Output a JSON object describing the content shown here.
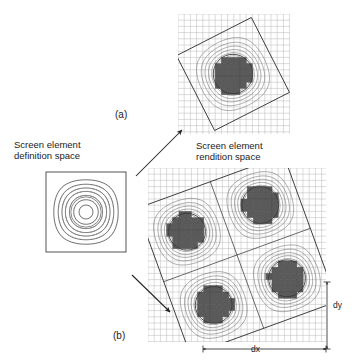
{
  "figure": {
    "title_caption": "",
    "labels": {
      "definition_space": "Screen element\ndefinition space",
      "rendition_space": "Screen element\nrendition space",
      "panel_a": "(a)",
      "panel_b": "(b)",
      "dx": "dx",
      "dy": "dy"
    },
    "colors": {
      "background": "#ffffff",
      "grid_line": "#b9b9b9",
      "contour_line": "#555555",
      "frame_line": "#2a2a2a",
      "disc_fill": "#5a5a5a",
      "disc_stroke": "#3a3a3a",
      "arrow": "#222222",
      "text": "#1b1b1b"
    },
    "panels": [
      {
        "id": "definition-space",
        "name": "Screen element definition space",
        "type": "contour",
        "shape": "axis-aligned-square",
        "x": 46,
        "y": 172,
        "width": 80,
        "height": 80,
        "rotation_deg": 0,
        "grid": false,
        "discs": [
          {
            "cx": 0.5,
            "cy": 0.5,
            "r": 0.19,
            "filled": false
          }
        ],
        "contour_levels": [
          0.12,
          0.24,
          0.36,
          0.48,
          0.62,
          0.76,
          0.9
        ]
      },
      {
        "id": "rendition-space-a",
        "name": "Screen element rendition space (single element)",
        "type": "contour-rasterized",
        "shape": "rotated-square",
        "grid_x": 178,
        "grid_y": 14,
        "grid_w": 112,
        "grid_h": 120,
        "grid_cell": 6.2,
        "rotation_deg": -27,
        "square_cx": 233,
        "square_cy": 74,
        "square_half": 42,
        "tiles_x": 1,
        "tiles_y": 1,
        "discs": [
          {
            "cx": 0.5,
            "cy": 0.5,
            "r": 0.235,
            "filled": true
          }
        ]
      },
      {
        "id": "rendition-space-b",
        "name": "Screen element rendition space (2x2 tiled elements)",
        "type": "contour-rasterized",
        "shape": "rotated-square",
        "grid_x": 148,
        "grid_y": 168,
        "grid_w": 178,
        "grid_h": 174,
        "grid_cell": 6.2,
        "rotation_deg": -20,
        "square_cx": 237,
        "square_cy": 255,
        "square_half": 78,
        "tiles_x": 2,
        "tiles_y": 2,
        "discs": [
          {
            "cx": 0.25,
            "cy": 0.25,
            "r": 0.118,
            "filled": true
          },
          {
            "cx": 0.75,
            "cy": 0.25,
            "r": 0.118,
            "filled": true
          },
          {
            "cx": 0.25,
            "cy": 0.75,
            "r": 0.118,
            "filled": true
          },
          {
            "cx": 0.75,
            "cy": 0.75,
            "r": 0.118,
            "filled": true
          }
        ]
      }
    ],
    "arrows": [
      {
        "id": "arrow-to-a",
        "x1": 136,
        "y1": 176,
        "x2": 182,
        "y2": 130,
        "head": "end"
      },
      {
        "id": "arrow-to-b",
        "x1": 132,
        "y1": 275,
        "x2": 170,
        "y2": 312,
        "head": "end"
      }
    ],
    "dimension_markers": [
      {
        "id": "dx",
        "orientation": "horizontal",
        "x1": 203,
        "y1": 349,
        "x2": 326,
        "y2": 349,
        "label": "dx"
      },
      {
        "id": "dy",
        "orientation": "vertical",
        "x1": 327,
        "y1": 282,
        "x2": 327,
        "y2": 349,
        "label": "dy"
      }
    ]
  }
}
